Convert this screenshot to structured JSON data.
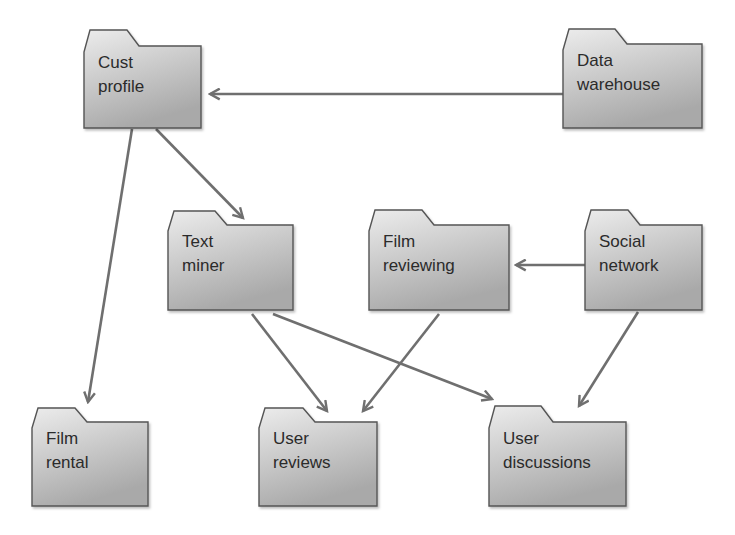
{
  "diagram": {
    "colors": {
      "folder_fill_top": "#e8e8e8",
      "folder_fill_bottom": "#aeaeae",
      "folder_stroke": "#555555",
      "arrow": "#6f6f6f",
      "text": "#2b2b2b",
      "background": "#ffffff"
    },
    "nodes": [
      {
        "id": "cust-profile",
        "line1": "Cust",
        "line2": "profile",
        "x": 84,
        "tabTop": 30,
        "top": 46,
        "right": 201,
        "bottom": 128
      },
      {
        "id": "data-warehouse",
        "line1": "Data",
        "line2": "warehouse",
        "x": 563,
        "tabTop": 29,
        "top": 44,
        "right": 702,
        "bottom": 128
      },
      {
        "id": "text-miner",
        "line1": "Text",
        "line2": "miner",
        "x": 168,
        "tabTop": 211,
        "top": 225,
        "right": 293,
        "bottom": 310
      },
      {
        "id": "film-reviewing",
        "line1": "Film",
        "line2": "reviewing",
        "x": 369,
        "tabTop": 210,
        "top": 225,
        "right": 509,
        "bottom": 310
      },
      {
        "id": "social-network",
        "line1": "Social",
        "line2": "network",
        "x": 585,
        "tabTop": 210,
        "top": 225,
        "right": 702,
        "bottom": 310
      },
      {
        "id": "film-rental",
        "line1": "Film",
        "line2": "rental",
        "x": 32,
        "tabTop": 408,
        "top": 422,
        "right": 148,
        "bottom": 506
      },
      {
        "id": "user-reviews",
        "line1": "User",
        "line2": "reviews",
        "x": 259,
        "tabTop": 408,
        "top": 422,
        "right": 377,
        "bottom": 506
      },
      {
        "id": "user-discussions",
        "line1": "User",
        "line2": "discussions",
        "x": 489,
        "tabTop": 406,
        "top": 422,
        "right": 626,
        "bottom": 506
      }
    ],
    "edges": [
      {
        "from": "data-warehouse",
        "to": "cust-profile",
        "x1": 563,
        "y1": 94,
        "x2": 210,
        "y2": 94
      },
      {
        "from": "cust-profile",
        "to": "text-miner",
        "x1": 156,
        "y1": 129,
        "x2": 243,
        "y2": 218
      },
      {
        "from": "cust-profile",
        "to": "film-rental",
        "x1": 132,
        "y1": 129,
        "x2": 88,
        "y2": 402
      },
      {
        "from": "social-network",
        "to": "film-reviewing",
        "x1": 585,
        "y1": 265,
        "x2": 516,
        "y2": 265
      },
      {
        "from": "text-miner",
        "to": "user-reviews",
        "x1": 252,
        "y1": 314,
        "x2": 327,
        "y2": 411
      },
      {
        "from": "text-miner",
        "to": "user-discussions",
        "x1": 273,
        "y1": 314,
        "x2": 492,
        "y2": 399
      },
      {
        "from": "film-reviewing",
        "to": "user-reviews",
        "x1": 439,
        "y1": 314,
        "x2": 363,
        "y2": 411
      },
      {
        "from": "social-network",
        "to": "user-discussions",
        "x1": 638,
        "y1": 312,
        "x2": 579,
        "y2": 406
      }
    ]
  }
}
